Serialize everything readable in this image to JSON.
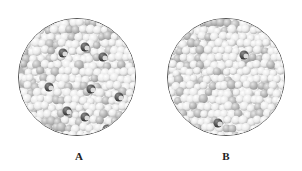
{
  "figure": {
    "panels": [
      {
        "id": "A",
        "label": "A",
        "description": "Close-packed spheres (light gray) with scattered dark dopant/impurity atoms",
        "dark_particles": [
          [
            44,
            34
          ],
          [
            66,
            28
          ],
          [
            84,
            38
          ],
          [
            30,
            68
          ],
          [
            72,
            70
          ],
          [
            100,
            78
          ],
          [
            48,
            92
          ],
          [
            66,
            98
          ],
          [
            88,
            110
          ],
          [
            60,
            124
          ]
        ]
      },
      {
        "id": "B",
        "label": "B",
        "description": "Close-packed spheres with fewer, smaller dark particles",
        "dark_particles": [
          [
            76,
            36
          ],
          [
            50,
            104
          ],
          [
            86,
            116
          ]
        ]
      }
    ],
    "colors": {
      "background": "#ffffff",
      "sphere_light": "#ececec",
      "sphere_mid": "#bdbdbd",
      "sphere_dark": "#2e2e2e",
      "circle_border": "#555555"
    }
  }
}
